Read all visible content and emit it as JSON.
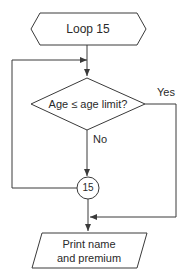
{
  "flowchart": {
    "loop_start": {
      "label": "Loop 15",
      "shape": "hexagon"
    },
    "decision": {
      "label": "Age ≤ age limit?",
      "shape": "diamond",
      "yes_label": "Yes",
      "no_label": "No"
    },
    "connector": {
      "label": "15",
      "shape": "circle"
    },
    "output": {
      "line1": "Print name",
      "line2": "and premium",
      "shape": "parallelogram"
    },
    "colors": {
      "stroke": "#3a3a3a",
      "text": "#2a2a2a",
      "background": "#ffffff"
    }
  }
}
